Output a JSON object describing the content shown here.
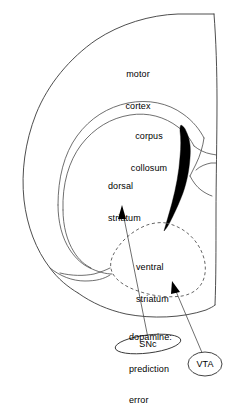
{
  "figure": {
    "type": "anatomical-diagram",
    "background_color": "#ffffff",
    "line_color": "#3a3a3a",
    "fill_color": "#000000",
    "text_color": "#000000"
  },
  "labels": {
    "motor_cortex": {
      "line1": "motor",
      "line2": "cortex"
    },
    "corpus_callosum": {
      "line1": "corpus",
      "line2": "collosum"
    },
    "dorsal_striatum": {
      "line1": "dorsal",
      "line2": "striatum"
    },
    "ventral_striatum": {
      "line1": "ventral",
      "line2": "striatum"
    },
    "dopamine_signal": {
      "line1": "dopamine:",
      "line2": "prediction",
      "line3": "error"
    },
    "snc": "SNc",
    "vta": "VTA"
  },
  "regions": [
    {
      "name": "motor cortex",
      "style": "outline"
    },
    {
      "name": "corpus collosum",
      "style": "outline"
    },
    {
      "name": "dorsal striatum",
      "style": "outline"
    },
    {
      "name": "ventral striatum",
      "style": "dashed-outline"
    },
    {
      "name": "internal capsule",
      "style": "solid-black-fill"
    },
    {
      "name": "SNc",
      "style": "ellipse-outline"
    },
    {
      "name": "VTA",
      "style": "ellipse-outline"
    }
  ],
  "projections": [
    {
      "name": "snc-to-dorsal-striatum",
      "source": "SNc",
      "target": "dorsal striatum",
      "annotation": "dopamine: prediction error",
      "arrow": "filled"
    },
    {
      "name": "vta-to-ventral-striatum",
      "source": "VTA",
      "target": "ventral striatum",
      "annotation": "dopamine: prediction error",
      "arrow": "filled"
    }
  ]
}
